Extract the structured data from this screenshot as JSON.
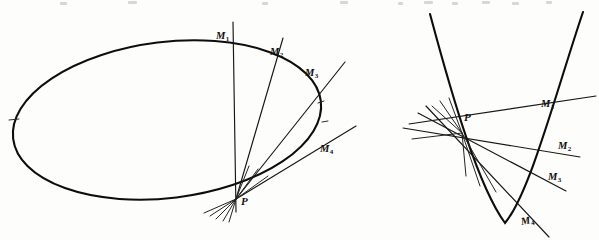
{
  "page": {
    "background_color": "#fdfdfc",
    "ink_color": "#0d0d0d",
    "width": 599,
    "height": 240,
    "media": "scanned-textbook-figure"
  },
  "figures": [
    {
      "id": "ellipse-figure",
      "name": "ellipse-secants-figure",
      "curve_type": "ellipse",
      "point_labels": {
        "vertex_point": "P",
        "secant_points": [
          "M",
          "M",
          "M",
          "M"
        ],
        "secant_subscripts": [
          "1",
          "2",
          "3",
          "4"
        ]
      },
      "labels": [
        {
          "text": "M",
          "sub": "1",
          "x": 216,
          "y": 31,
          "name": "label-m1-ellipse"
        },
        {
          "text": "M",
          "sub": "2",
          "x": 270,
          "y": 47,
          "name": "label-m2-ellipse"
        },
        {
          "text": "M",
          "sub": "3",
          "x": 305,
          "y": 68,
          "name": "label-m3-ellipse"
        },
        {
          "text": "M",
          "sub": "4",
          "x": 320,
          "y": 144,
          "name": "label-m4-ellipse"
        },
        {
          "text": "P",
          "sub": "",
          "x": 241,
          "y": 196,
          "name": "label-p-ellipse"
        }
      ]
    },
    {
      "id": "parabola-figure",
      "name": "parabola-secants-figure",
      "curve_type": "parabola",
      "point_labels": {
        "vertex_point": "P",
        "secant_points": [
          "M",
          "M",
          "M",
          "M"
        ],
        "secant_subscripts": [
          "1",
          "2",
          "3",
          "4"
        ]
      },
      "labels": [
        {
          "text": "M",
          "sub": "1",
          "x": 541,
          "y": 99,
          "name": "label-m1-parabola"
        },
        {
          "text": "M",
          "sub": "2",
          "x": 558,
          "y": 141,
          "name": "label-m2-parabola"
        },
        {
          "text": "M",
          "sub": "3",
          "x": 548,
          "y": 172,
          "name": "label-m3-parabola"
        },
        {
          "text": "M",
          "sub": "4",
          "x": 521,
          "y": 216,
          "name": "label-m4-parabola"
        },
        {
          "text": "P",
          "sub": "",
          "x": 464,
          "y": 112,
          "name": "label-p-parabola"
        }
      ]
    }
  ],
  "geometry": {
    "ellipse": {
      "center_x": 167,
      "center_y": 120,
      "radius_x": 155,
      "radius_y": 78,
      "rotation_deg": -8,
      "p_point": {
        "x": 236,
        "y": 199
      },
      "secant_endpoints": [
        {
          "label": "M1",
          "x": 233,
          "y": 42
        },
        {
          "label": "M2",
          "x": 271,
          "y": 57
        },
        {
          "label": "M3",
          "x": 305,
          "y": 88
        },
        {
          "label": "M4",
          "x": 313,
          "y": 148
        }
      ]
    },
    "parabola": {
      "vertex_x": 505,
      "vertex_y": 223,
      "left_arm_top": {
        "x": 430,
        "y": 14
      },
      "right_arm_top": {
        "x": 583,
        "y": 12
      },
      "p_point": {
        "x": 462,
        "y": 133
      },
      "secant_endpoints": [
        {
          "label": "M1",
          "x": 552,
          "y": 110
        },
        {
          "label": "M2",
          "x": 564,
          "y": 152
        },
        {
          "label": "M3",
          "x": 553,
          "y": 184
        },
        {
          "label": "M4",
          "x": 528,
          "y": 223
        }
      ]
    }
  }
}
